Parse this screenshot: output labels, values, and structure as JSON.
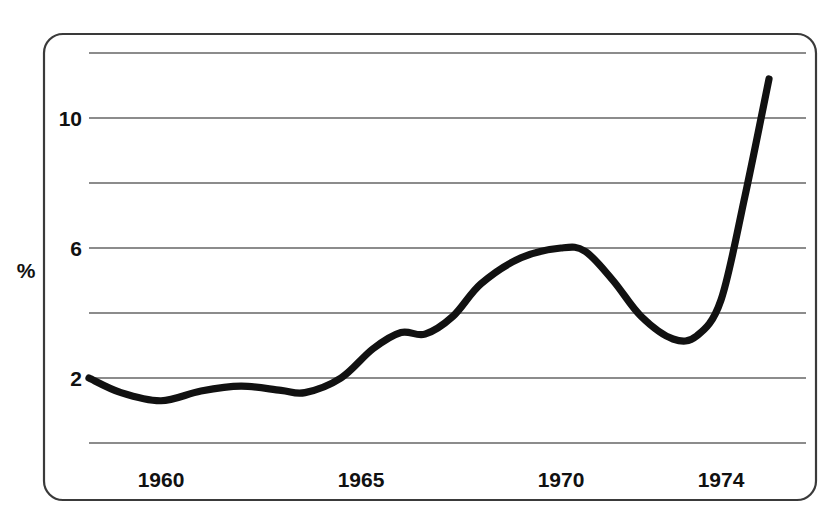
{
  "chart_data": {
    "type": "line",
    "title": "",
    "xlabel": "",
    "ylabel": "%",
    "xlim": [
      1958.2,
      1975.3
    ],
    "ylim": [
      0,
      12
    ],
    "grid": true,
    "legend": false,
    "legend_position": "none",
    "y_gridline_values": [
      0,
      2,
      4,
      6,
      8,
      10,
      12
    ],
    "y_tick_labels": [
      "2",
      "6",
      "10"
    ],
    "y_tick_values": [
      2,
      6,
      10
    ],
    "x_tick_labels": [
      "1960",
      "1965",
      "1970",
      "1974"
    ],
    "x_tick_values": [
      1960,
      1965,
      1970,
      1974
    ],
    "series": [
      {
        "name": "rate",
        "color": "#111111",
        "x": [
          1958.2,
          1959.0,
          1960.0,
          1961.0,
          1962.0,
          1963.0,
          1963.6,
          1964.5,
          1965.3,
          1966.0,
          1966.6,
          1967.3,
          1968.0,
          1969.0,
          1970.0,
          1970.6,
          1971.3,
          1972.0,
          1972.8,
          1973.4,
          1974.0,
          1974.6,
          1975.2
        ],
        "y": [
          2.0,
          1.55,
          1.3,
          1.6,
          1.75,
          1.62,
          1.55,
          2.0,
          2.9,
          3.4,
          3.35,
          3.9,
          4.9,
          5.7,
          6.0,
          5.9,
          5.0,
          3.9,
          3.2,
          3.3,
          4.4,
          7.6,
          11.2
        ]
      }
    ],
    "annotations": []
  },
  "axis": {
    "y_label": "%"
  }
}
